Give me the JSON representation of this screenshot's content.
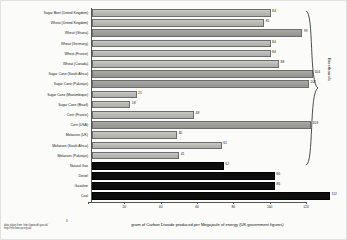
{
  "chart_data": {
    "type": "bar",
    "orientation": "horizontal",
    "title": "",
    "xlabel": "gram of Carbon Dioxide produced per Megajoule of energy (UK government figures)",
    "ylabel": "",
    "xlim": [
      0,
      120
    ],
    "xticks": [
      0,
      20,
      40,
      60,
      80,
      100,
      120
    ],
    "xticklabels": [
      "0",
      "20",
      "40",
      "60",
      "80",
      "100",
      "120"
    ],
    "grid": false,
    "legend": "none",
    "categories": [
      "Sugar Beet (United Kingdom)",
      "Wheat (United Kingdom)",
      "Wheat (Ghana)",
      "Wheat (Germany)",
      "Wheat (France)",
      "Wheat (Canada)",
      "Sugar Cane (South Africa)",
      "Sugar Cane (Pakistan)",
      "Sugar Cane (Mozambique)",
      "Sugar Cane (Brazil)",
      "Corn (France)",
      "Corn (USA)",
      "Molasses (UK)",
      "Molasses (South Africa)",
      "Molasses (Pakistan)",
      "Natural Gas",
      "Diesel",
      "Gasoline",
      "Coal"
    ],
    "values": [
      84,
      81,
      99,
      84,
      84,
      88,
      104,
      102,
      21,
      18,
      48,
      103,
      40,
      61,
      41,
      62,
      86,
      86,
      112
    ],
    "groups": [
      "biofuel",
      "biofuel",
      "biofuel",
      "biofuel",
      "biofuel",
      "biofuel",
      "biofuel",
      "biofuel",
      "biofuel",
      "biofuel",
      "biofuel",
      "biofuel",
      "biofuel",
      "biofuel",
      "biofuel",
      "fossil",
      "fossil",
      "fossil",
      "fossil"
    ],
    "annotations": {
      "group_brace_label": "Bioethanols"
    }
  },
  "colors": {
    "biofuel_bar": "#b9b9b5",
    "fossil_bar": "#0d0d0d",
    "axis": "#555555",
    "background": "#fbfbf9",
    "text": "#1d1d1d"
  },
  "footnote": {
    "line1": "data taken from: http://www.dft.gov.uk/",
    "line2": "http://rtfo.lowcvp.org.uk/",
    "corner_mark": "0"
  }
}
